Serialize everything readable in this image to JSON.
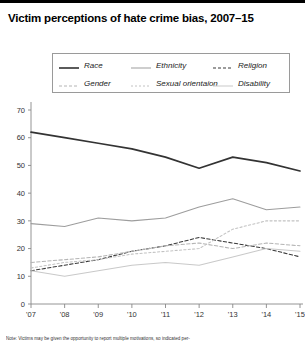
{
  "title": "Victim perceptions of hate crime bias, 2007–15",
  "caption": "Note: Victims may be given the opportunity to report multiple motivations, so indicated per-",
  "legend": {
    "items": [
      {
        "label": "Race",
        "style": "solid",
        "color": "#333333",
        "width": 1.6,
        "col": 0,
        "row": 0
      },
      {
        "label": "Ethnicity",
        "style": "solid",
        "color": "#9d9d9d",
        "width": 1.0,
        "col": 1,
        "row": 0
      },
      {
        "label": "Religion",
        "style": "dash",
        "color": "#3a3a3a",
        "width": 1.2,
        "col": 2,
        "row": 0
      },
      {
        "label": "Gender",
        "style": "dash",
        "color": "#b4b4b4",
        "width": 1.0,
        "col": 0,
        "row": 1
      },
      {
        "label": "Sexual orientaion",
        "style": "dot",
        "color": "#c2c2c2",
        "width": 1.0,
        "col": 1,
        "row": 1
      },
      {
        "label": "Disability",
        "style": "solid",
        "color": "#c9c9c9",
        "width": 1.0,
        "col": 2,
        "row": 1
      }
    ]
  },
  "chart_data": {
    "type": "line",
    "title": "Victim perceptions of hate crime bias, 2007–15",
    "xlabel": "",
    "ylabel": "",
    "x": [
      "'07",
      "'08",
      "'09",
      "'10",
      "'11",
      "'12",
      "'13",
      "'14",
      "'15"
    ],
    "categories": [
      "'07",
      "'08",
      "'09",
      "'10",
      "'11",
      "'12",
      "'13",
      "'14",
      "'15"
    ],
    "ylim": [
      0,
      70
    ],
    "yticks": [
      0,
      10,
      20,
      30,
      40,
      50,
      60,
      70
    ],
    "grid": false,
    "legend_position": "top",
    "series": [
      {
        "name": "Race",
        "values": [
          62,
          60,
          58,
          56,
          53,
          49,
          53,
          51,
          48
        ],
        "style": "solid",
        "color": "#333333"
      },
      {
        "name": "Ethnicity",
        "values": [
          29,
          28,
          31,
          30,
          31,
          35,
          38,
          34,
          35
        ],
        "style": "solid",
        "color": "#9d9d9d"
      },
      {
        "name": "Religion",
        "values": [
          12,
          14,
          16,
          19,
          21,
          24,
          22,
          20,
          17
        ],
        "style": "dash",
        "color": "#3a3a3a"
      },
      {
        "name": "Gender",
        "values": [
          15,
          16,
          17,
          19,
          21,
          22,
          20,
          22,
          21
        ],
        "style": "dash",
        "color": "#b4b4b4"
      },
      {
        "name": "Sexual orientaion",
        "values": [
          13,
          15,
          16,
          18,
          19,
          20,
          27,
          30,
          30
        ],
        "style": "dot",
        "color": "#c2c2c2"
      },
      {
        "name": "Disability",
        "values": [
          12,
          10,
          12,
          14,
          15,
          14,
          17,
          20,
          19
        ],
        "style": "solid",
        "color": "#c9c9c9"
      }
    ]
  }
}
